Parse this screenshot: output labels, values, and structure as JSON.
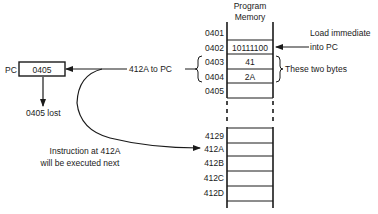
{
  "memory": {
    "title_line1": "Program",
    "title_line2": "Memory",
    "top_rows": [
      {
        "address": "0401",
        "value": ""
      },
      {
        "address": "0402",
        "value": "10111100"
      },
      {
        "address": "0403",
        "value": "41"
      },
      {
        "address": "0404",
        "value": "2A"
      },
      {
        "address": "0405",
        "value": ""
      }
    ],
    "bottom_rows": [
      {
        "address": "4129",
        "value": ""
      },
      {
        "address": "412A",
        "value": ""
      },
      {
        "address": "412B",
        "value": ""
      },
      {
        "address": "412C",
        "value": ""
      },
      {
        "address": "412D",
        "value": ""
      }
    ]
  },
  "pc": {
    "label": "PC",
    "value": "0405",
    "lost_label": "0405 lost"
  },
  "annotations": {
    "load_immediate_line1": "Load immediate",
    "load_immediate_line2": "into PC",
    "these_two_bytes": "These two bytes",
    "to_pc": "412A to PC",
    "next_instruction_line1": "Instruction at 412A",
    "next_instruction_line2": "will be executed next"
  }
}
